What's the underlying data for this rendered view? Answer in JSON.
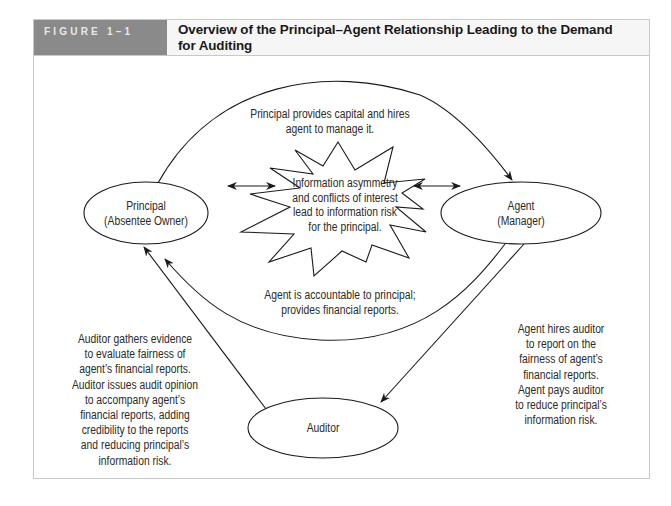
{
  "figure": {
    "label": "FIGURE 1–1",
    "title_line1": "Overview of the Principal–Agent Relationship Leading to the Demand",
    "title_line2": "for Auditing"
  },
  "nodes": {
    "principal": {
      "line1": "Principal",
      "line2": "(Absentee Owner)"
    },
    "agent": {
      "line1": "Agent",
      "line2": "(Manager)"
    },
    "auditor": {
      "line1": "Auditor"
    },
    "risk": {
      "lines": [
        "Information asymmetry",
        "and conflicts of interest",
        "lead to information risk",
        "for the principal."
      ]
    }
  },
  "edges": {
    "principal_to_agent": {
      "lines": [
        "Principal provides capital and hires",
        "agent to manage it."
      ]
    },
    "agent_to_principal": {
      "lines": [
        "Agent is accountable to principal;",
        "provides financial reports."
      ]
    },
    "agent_to_auditor": {
      "lines": [
        "Agent hires auditor",
        "to report on the",
        "fairness of agent’s",
        "financial reports.",
        "Agent pays auditor",
        "to reduce principal’s",
        "information risk."
      ]
    },
    "auditor_to_principal": {
      "lines": [
        "Auditor gathers evidence",
        "to evaluate fairness of",
        "agent’s financial reports.",
        "Auditor issues audit opinion",
        "to accompany agent’s",
        "financial reports, adding",
        "credibility to the reports",
        "and reducing principal’s",
        "information risk."
      ]
    }
  },
  "colors": {
    "header_label_bg": "#8a8a8a",
    "header_title_bg": "#f6f6f6",
    "line": "#1a1a1a",
    "border": "#c8c8c8"
  }
}
